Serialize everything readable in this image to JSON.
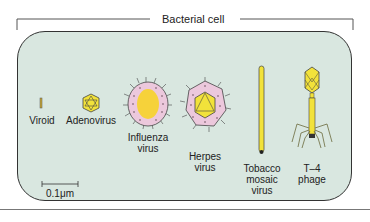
{
  "title": "Bacterial cell",
  "viruses": [
    {
      "name": "viroid",
      "label": "Viroid"
    },
    {
      "name": "adenovirus",
      "label": "Adenovirus"
    },
    {
      "name": "influenza",
      "label_line1": "Influenza",
      "label_line2": "virus"
    },
    {
      "name": "herpes",
      "label_line1": "Herpes",
      "label_line2": "virus"
    },
    {
      "name": "tobacco-mosaic",
      "label_line1": "Tobacco",
      "label_line2": "mosaic",
      "label_line3": "virus"
    },
    {
      "name": "t4-phage",
      "label_line1": "T–4",
      "label_line2": "phage"
    }
  ],
  "scale_bar": {
    "label": "0.1μm"
  },
  "colors": {
    "cell_fill": "#d9e7e0",
    "capsid_yellow": "#f2e23a",
    "envelope_pink": "#ecc8dc",
    "outline": "#333333"
  }
}
